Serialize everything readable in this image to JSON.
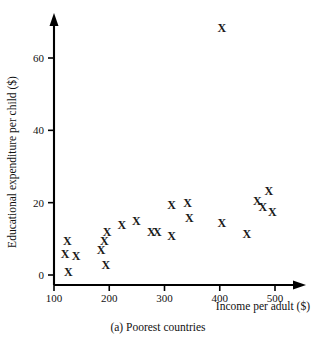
{
  "chart_data": {
    "type": "scatter",
    "title": "",
    "caption": "(a)  Poorest countries",
    "caption_prefix": "(a)",
    "caption_label": "Poorest countries",
    "xlabel": "Income per adult ($)",
    "ylabel": "Educational expenditure per child ($)",
    "xlim": [
      100,
      540
    ],
    "ylim": [
      0,
      72
    ],
    "xticks": [
      100,
      200,
      300,
      400,
      500
    ],
    "yticks": [
      0,
      20,
      40,
      60
    ],
    "xtick_labels": [
      "100",
      "200",
      "300",
      "400",
      "500"
    ],
    "ytick_labels": [
      "0",
      "20",
      "40",
      "60"
    ],
    "grid": false,
    "legend": null,
    "marker": "x",
    "marker_color": "#1a1a1a",
    "series": [
      {
        "name": "Poorest countries",
        "points": [
          {
            "x": 124,
            "y": 9
          },
          {
            "x": 120,
            "y": 5.5
          },
          {
            "x": 140,
            "y": 5
          },
          {
            "x": 126,
            "y": 0.5
          },
          {
            "x": 196,
            "y": 11.5
          },
          {
            "x": 191,
            "y": 9
          },
          {
            "x": 185,
            "y": 6.5
          },
          {
            "x": 194,
            "y": 2.5
          },
          {
            "x": 223,
            "y": 13.5
          },
          {
            "x": 249,
            "y": 14.5
          },
          {
            "x": 276,
            "y": 11.5
          },
          {
            "x": 287,
            "y": 11.5
          },
          {
            "x": 313,
            "y": 10.5
          },
          {
            "x": 313,
            "y": 19
          },
          {
            "x": 342,
            "y": 19.5
          },
          {
            "x": 345,
            "y": 15.5
          },
          {
            "x": 404,
            "y": 14
          },
          {
            "x": 449,
            "y": 11
          },
          {
            "x": 468,
            "y": 20
          },
          {
            "x": 478,
            "y": 18.5
          },
          {
            "x": 489,
            "y": 23
          },
          {
            "x": 495,
            "y": 17
          },
          {
            "x": 404,
            "y": 68
          }
        ]
      }
    ]
  },
  "geometry": {
    "x_axis_px": {
      "x100": 54,
      "x500": 275,
      "origin_y": 285,
      "arrow_end": 303
    },
    "y_axis_px": {
      "y0": 275,
      "y60": 58,
      "axis_x": 54,
      "arrow_top": 17
    }
  }
}
